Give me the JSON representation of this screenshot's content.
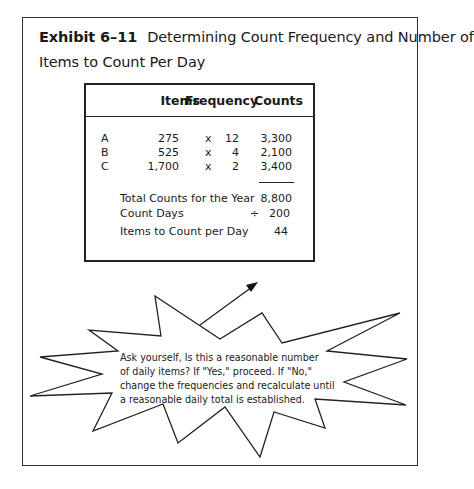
{
  "exhibit": {
    "number": "Exhibit 6–11",
    "title_line1": "Determining Count Frequency and Number of",
    "title_line2": "Items to Count Per Day"
  },
  "table": {
    "headers": {
      "items": "Items",
      "frequency": "Frequency",
      "counts": "Counts"
    },
    "rows": [
      {
        "class": "A",
        "items": "275",
        "times": "x",
        "frequency": "12",
        "counts": "3,300"
      },
      {
        "class": "B",
        "items": "525",
        "times": "x",
        "frequency": "4",
        "counts": "2,100"
      },
      {
        "class": "C",
        "items": "1,700",
        "times": "x",
        "frequency": "2",
        "counts": "3,400"
      }
    ],
    "summary": {
      "total_label": "Total Counts for the Year",
      "total_value": "8,800",
      "count_days_label": "Count Days",
      "divide_sign": "÷",
      "count_days_value": "200",
      "per_day_label": "Items to Count per Day",
      "per_day_value": "44"
    }
  },
  "callout": {
    "shape": "starburst",
    "arrow": "arrow-pointing-up-right",
    "lines": [
      "Ask yourself, Is this a reasonable number",
      "of daily items? If  \"Yes,\" proceed. If \"No,\"",
      "change the frequencies and recalculate until",
      "a reasonable daily total is established."
    ]
  },
  "colors": {
    "ink": "#1a1a1a",
    "border": "#333333",
    "background": "#ffffff"
  }
}
